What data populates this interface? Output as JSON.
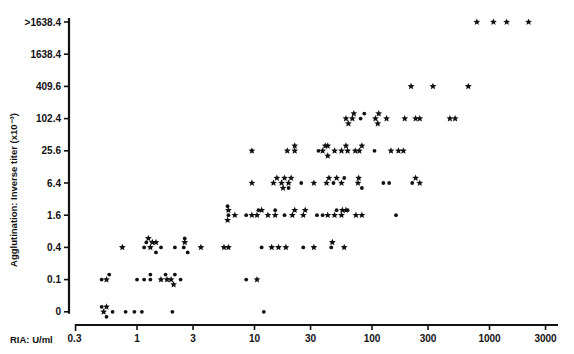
{
  "chart_data": {
    "type": "scatter",
    "title": "",
    "xlabel": "RIA: U/ml",
    "ylabel": "Agglutination: Inverse titer (x10⁻³)",
    "x_scale": "log",
    "x_ticks": [
      0.3,
      1,
      3,
      10,
      30,
      100,
      300,
      1000,
      3000
    ],
    "x_tick_labels": [
      "0.3",
      "1",
      "3",
      "10",
      "30",
      "100",
      "300",
      "1000",
      "3000"
    ],
    "y_scale": "categorical-log2",
    "y_tick_labels": [
      "0",
      "0.1",
      "0.4",
      "1.6",
      "6.4",
      "25.6",
      "102.4",
      "409.6",
      "1638.4",
      ">1638.4"
    ],
    "grid": false,
    "legend": "none",
    "marker_types": [
      "dot",
      "star"
    ],
    "series": [
      {
        "name": "0",
        "points": [
          [
            0.52,
            "star"
          ],
          [
            0.55,
            "star"
          ],
          [
            0.5,
            "dot"
          ],
          [
            0.55,
            "dot"
          ],
          [
            0.62,
            "dot"
          ],
          [
            0.8,
            "dot"
          ],
          [
            0.95,
            "dot"
          ],
          [
            1.1,
            "dot"
          ],
          [
            2.0,
            "dot"
          ],
          [
            12,
            "dot"
          ]
        ]
      },
      {
        "name": "0.1",
        "points": [
          [
            0.5,
            "dot"
          ],
          [
            0.55,
            "star"
          ],
          [
            0.58,
            "dot"
          ],
          [
            1.0,
            "dot"
          ],
          [
            1.15,
            "dot"
          ],
          [
            1.3,
            "dot"
          ],
          [
            1.3,
            "dot"
          ],
          [
            1.6,
            "star"
          ],
          [
            1.8,
            "star"
          ],
          [
            1.75,
            "dot"
          ],
          [
            1.95,
            "star"
          ],
          [
            2.1,
            "dot"
          ],
          [
            2.05,
            "star"
          ],
          [
            2.35,
            "dot"
          ],
          [
            8.5,
            "dot"
          ],
          [
            10.5,
            "star"
          ]
        ]
      },
      {
        "name": "0.4",
        "points": [
          [
            0.75,
            "star"
          ],
          [
            1.15,
            "dot"
          ],
          [
            1.2,
            "dot"
          ],
          [
            1.3,
            "star"
          ],
          [
            1.35,
            "star"
          ],
          [
            1.25,
            "star"
          ],
          [
            1.45,
            "star"
          ],
          [
            1.45,
            "dot"
          ],
          [
            1.6,
            "dot"
          ],
          [
            2.1,
            "dot"
          ],
          [
            2.5,
            "dot"
          ],
          [
            2.55,
            "star"
          ],
          [
            2.7,
            "dot"
          ],
          [
            2.55,
            "dot"
          ],
          [
            3.5,
            "star"
          ],
          [
            5.5,
            "star"
          ],
          [
            6.0,
            "star"
          ],
          [
            11.5,
            "dot"
          ],
          [
            14,
            "star"
          ],
          [
            16,
            "star"
          ],
          [
            18.5,
            "star"
          ],
          [
            26,
            "dot"
          ],
          [
            32,
            "star"
          ],
          [
            45,
            "dot"
          ],
          [
            46,
            "star"
          ],
          [
            58,
            "star"
          ]
        ]
      },
      {
        "name": "1.6",
        "points": [
          [
            6.0,
            "dot"
          ],
          [
            6.0,
            "star"
          ],
          [
            5.9,
            "star"
          ],
          [
            5.9,
            "dot"
          ],
          [
            6.8,
            "star"
          ],
          [
            8.5,
            "dot"
          ],
          [
            9.5,
            "star"
          ],
          [
            10.5,
            "star"
          ],
          [
            10.8,
            "dot"
          ],
          [
            11.5,
            "star"
          ],
          [
            13,
            "star"
          ],
          [
            15,
            "star"
          ],
          [
            15,
            "dot"
          ],
          [
            18,
            "dot"
          ],
          [
            21,
            "star"
          ],
          [
            22,
            "star"
          ],
          [
            26,
            "star"
          ],
          [
            27,
            "star"
          ],
          [
            34,
            "dot"
          ],
          [
            38,
            "dot"
          ],
          [
            42,
            "star"
          ],
          [
            48,
            "star"
          ],
          [
            50,
            "dot"
          ],
          [
            55,
            "star"
          ],
          [
            56,
            "star"
          ],
          [
            60,
            "star"
          ],
          [
            62,
            "dot"
          ],
          [
            73,
            "star"
          ],
          [
            82,
            "star"
          ],
          [
            160,
            "dot"
          ]
        ]
      },
      {
        "name": "6.4",
        "points": [
          [
            9.5,
            "star"
          ],
          [
            14.5,
            "star"
          ],
          [
            15.5,
            "star"
          ],
          [
            17,
            "star"
          ],
          [
            18,
            "star"
          ],
          [
            17.5,
            "star"
          ],
          [
            19.5,
            "star"
          ],
          [
            20.5,
            "star"
          ],
          [
            19.5,
            "dot"
          ],
          [
            25,
            "dot"
          ],
          [
            32,
            "star"
          ],
          [
            41,
            "star"
          ],
          [
            43,
            "star"
          ],
          [
            47,
            "dot"
          ],
          [
            50,
            "star"
          ],
          [
            55,
            "star"
          ],
          [
            58,
            "dot"
          ],
          [
            76,
            "star"
          ],
          [
            77,
            "star"
          ],
          [
            82,
            "dot"
          ],
          [
            125,
            "dot"
          ],
          [
            140,
            "dot"
          ],
          [
            220,
            "dot"
          ],
          [
            235,
            "star"
          ],
          [
            255,
            "star"
          ]
        ]
      },
      {
        "name": "25.6",
        "points": [
          [
            9.5,
            "star"
          ],
          [
            19,
            "star"
          ],
          [
            22,
            "star"
          ],
          [
            22,
            "star"
          ],
          [
            35,
            "dot"
          ],
          [
            38,
            "star"
          ],
          [
            40,
            "star"
          ],
          [
            42,
            "star"
          ],
          [
            42,
            "star"
          ],
          [
            48,
            "star"
          ],
          [
            55,
            "star"
          ],
          [
            62,
            "star"
          ],
          [
            60,
            "star"
          ],
          [
            72,
            "star"
          ],
          [
            78,
            "star"
          ],
          [
            82,
            "star"
          ],
          [
            105,
            "dot"
          ],
          [
            145,
            "star"
          ],
          [
            168,
            "star"
          ],
          [
            185,
            "star"
          ]
        ]
      },
      {
        "name": "102.4",
        "points": [
          [
            60,
            "star"
          ],
          [
            68,
            "star"
          ],
          [
            63,
            "star"
          ],
          [
            70,
            "star"
          ],
          [
            80,
            "dot"
          ],
          [
            86,
            "dot"
          ],
          [
            107,
            "star"
          ],
          [
            114,
            "star"
          ],
          [
            112,
            "star"
          ],
          [
            133,
            "star"
          ],
          [
            190,
            "star"
          ],
          [
            235,
            "star"
          ],
          [
            255,
            "star"
          ],
          [
            460,
            "star"
          ],
          [
            510,
            "star"
          ]
        ]
      },
      {
        "name": "409.6",
        "points": [
          [
            215,
            "star"
          ],
          [
            330,
            "star"
          ],
          [
            660,
            "star"
          ]
        ]
      },
      {
        "name": "1638.4",
        "points": []
      },
      {
        "name": ">1638.4",
        "points": [
          [
            780,
            "star"
          ],
          [
            1080,
            "star"
          ],
          [
            1400,
            "star"
          ],
          [
            2150,
            "star"
          ]
        ]
      }
    ]
  },
  "axes": {
    "y_title": "Agglutination: Inverse titer (x10⁻³)",
    "x_title": "RIA: U/ml"
  },
  "colors": {
    "ink": "#111111",
    "background": "#ffffff"
  }
}
